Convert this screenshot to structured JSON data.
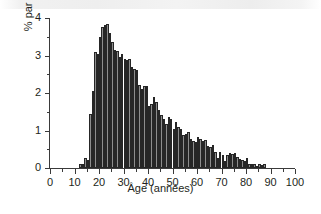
{
  "figure": {
    "kind": "histogram-figure",
    "background_color": "#ffffff",
    "bar_fill_color": "#8d8d8d",
    "bar_edge_color": "#262626",
    "axis_color": "#3a3a3a",
    "text_color": "#231f20",
    "scan_strip_label": "scan-artifact-strip"
  },
  "chart_data": {
    "type": "bar",
    "title": "",
    "subtitle": "",
    "xlabel": "Âge (années)",
    "ylabel": "% par année",
    "xlim": [
      0,
      100
    ],
    "ylim": [
      0,
      4
    ],
    "grid": false,
    "legend": null,
    "legend_position": "none",
    "bar_width_years": 1,
    "x_major_ticks": [
      0,
      10,
      20,
      30,
      40,
      50,
      60,
      70,
      80,
      90,
      100
    ],
    "x_major_tick_labels": [
      "0",
      "10",
      "20",
      "30",
      "40",
      "50",
      "60",
      "70",
      "80",
      "90",
      "100"
    ],
    "x_minor_ticks": [
      5,
      15,
      25,
      35,
      45,
      55,
      65,
      75,
      85,
      95
    ],
    "y_major_ticks": [
      0,
      1,
      2,
      3,
      4
    ],
    "y_major_tick_labels": [
      "0",
      "1",
      "2",
      "3",
      "4"
    ],
    "y_minor_ticks": [
      0.5,
      1.5,
      2.5,
      3.5
    ],
    "categories": [
      12,
      13,
      14,
      15,
      16,
      17,
      18,
      19,
      20,
      21,
      22,
      23,
      24,
      25,
      26,
      27,
      28,
      29,
      30,
      31,
      32,
      33,
      34,
      35,
      36,
      37,
      38,
      39,
      40,
      41,
      42,
      43,
      44,
      45,
      46,
      47,
      48,
      49,
      50,
      51,
      52,
      53,
      54,
      55,
      56,
      57,
      58,
      59,
      60,
      61,
      62,
      63,
      64,
      65,
      66,
      67,
      68,
      69,
      70,
      71,
      72,
      73,
      74,
      75,
      76,
      77,
      78,
      79,
      80,
      81,
      82,
      83,
      84,
      85,
      86,
      87
    ],
    "values": [
      0.12,
      0.1,
      0.28,
      0.22,
      1.45,
      2.05,
      3.1,
      3.05,
      3.5,
      3.75,
      3.82,
      3.85,
      3.6,
      3.35,
      3.15,
      3.12,
      2.95,
      3.05,
      2.9,
      2.88,
      2.9,
      2.7,
      2.65,
      2.62,
      2.22,
      2.1,
      2.2,
      2.18,
      1.65,
      1.72,
      1.9,
      1.75,
      1.55,
      1.42,
      1.3,
      1.18,
      1.35,
      1.3,
      1.05,
      1.22,
      1.1,
      1.05,
      0.88,
      0.92,
      0.95,
      0.78,
      0.72,
      0.7,
      0.82,
      0.78,
      0.72,
      0.76,
      0.58,
      0.55,
      0.62,
      0.44,
      0.28,
      0.42,
      0.35,
      0.2,
      0.36,
      0.4,
      0.38,
      0.4,
      0.3,
      0.24,
      0.22,
      0.2,
      0.26,
      0.1,
      0.1,
      0.1,
      0.06,
      0.1,
      0.08,
      0.1
    ]
  }
}
